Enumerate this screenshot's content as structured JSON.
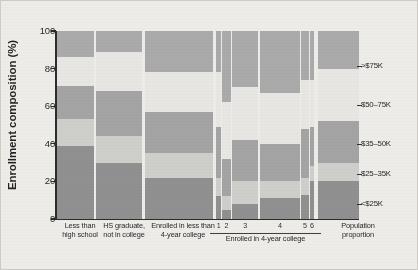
{
  "chart_data": {
    "type": "bar",
    "subtype": "stacked-mosaic-100pct",
    "title": "",
    "xlabel": "",
    "ylabel": "Enrollment composition (%)",
    "ylim": [
      0,
      100
    ],
    "yticks": [
      0,
      20,
      40,
      60,
      80,
      100
    ],
    "ytick_labels": [
      "0",
      "20",
      "40",
      "60",
      "80",
      "100"
    ],
    "grid": false,
    "legend_position": "right",
    "stack_order_bottom_to_top": [
      "<$25K",
      "$25-35K",
      "$35-50K",
      "$50-75K",
      ">$75K"
    ],
    "series": [
      {
        "name": "<$25K",
        "color": "#8e8e8e",
        "values": [
          39,
          30,
          22,
          12,
          5,
          8,
          11,
          13,
          20,
          20
        ]
      },
      {
        "name": "$25-35K",
        "color": "#cfcfcb",
        "values": [
          14,
          14,
          13,
          10,
          7,
          12,
          9,
          9,
          8,
          10
        ]
      },
      {
        "name": "$35-50K",
        "color": "#a3a3a3",
        "values": [
          18,
          24,
          22,
          27,
          20,
          22,
          20,
          26,
          21,
          22
        ]
      },
      {
        "name": "$50-75K",
        "color": "#e9e8e4",
        "values": [
          15,
          21,
          21,
          29,
          30,
          28,
          27,
          26,
          25,
          28
        ]
      },
      {
        "name": ">$75K",
        "color": "#a9a9a9",
        "values": [
          14,
          11,
          22,
          22,
          38,
          30,
          33,
          26,
          26,
          20
        ]
      }
    ],
    "categories": [
      {
        "label": "Less than high school",
        "group": null,
        "width_pct": 11.8
      },
      {
        "label": "HS graduate, not in college",
        "group": null,
        "width_pct": 14.6
      },
      {
        "label": "Enrolled in less than 4-year college",
        "group": null,
        "width_pct": 21.7
      },
      {
        "label": "1",
        "group": "Enrolled in 4-year college",
        "width_pct": 1.5
      },
      {
        "label": "2",
        "group": "Enrolled in 4-year college",
        "width_pct": 2.6
      },
      {
        "label": "3",
        "group": "Enrolled in 4-year college",
        "width_pct": 8.5
      },
      {
        "label": "4",
        "group": "Enrolled in 4-year college",
        "width_pct": 12.9
      },
      {
        "label": "5",
        "group": "Enrolled in 4-year college",
        "width_pct": 2.3
      },
      {
        "label": "6",
        "group": "Enrolled in 4-year college",
        "width_pct": 1.4
      },
      {
        "label": "Population proportion",
        "group": null,
        "width_pct": 13.0
      }
    ],
    "annotations": []
  },
  "axis": {
    "y_title": "Enrollment composition (%)",
    "y_tick_0": "0",
    "y_tick_20": "20",
    "y_tick_40": "40",
    "y_tick_60": "60",
    "y_tick_80": "80",
    "y_tick_100": "100"
  },
  "xlabels": {
    "cat1_line1": "Less than",
    "cat1_line2": "high school",
    "cat2_line1": "HS graduate,",
    "cat2_line2": "not in college",
    "cat3_line1": "Enrolled in less than",
    "cat3_line2": "4-year college",
    "tier1": "1",
    "tier2": "2",
    "tier3": "3",
    "tier4": "4",
    "tier5": "5",
    "tier6": "6",
    "group_label": "Enrolled in 4-year college",
    "pop_line1": "Population",
    "pop_line2": "proportion"
  },
  "legend": {
    "item1": ">$75K",
    "item2": "$50–75K",
    "item3": "$35–50K",
    "item4": "$25–35K",
    "item5": "<$25K"
  },
  "colors": {
    "income_lt25k": "#8e8e8e",
    "income_25_35k": "#cfcfcb",
    "income_35_50k": "#a3a3a3",
    "income_50_75k": "#e9e8e4",
    "income_gt75k": "#a9a9a9",
    "axis": "#262626",
    "background": "#efeeea"
  }
}
